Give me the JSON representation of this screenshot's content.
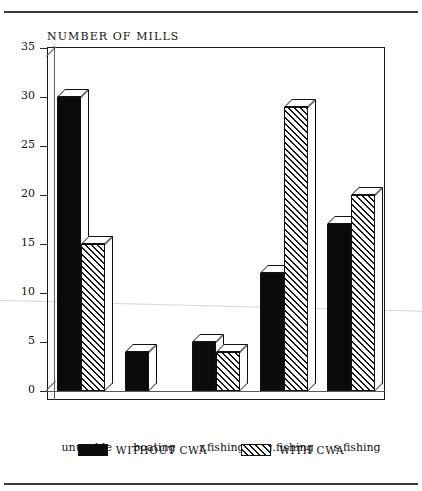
{
  "figure": {
    "title": "NUMBER OF MILLS",
    "rules": {
      "top": "page-rule-top",
      "bottom": "page-rule-bottom"
    }
  },
  "legend": {
    "entries": [
      {
        "label": "WITHOUT CWA",
        "pattern": "solid",
        "color": "#0b0b0b"
      },
      {
        "label": "WITH CWA",
        "pattern": "diagonal-hatch",
        "color": "#151515"
      }
    ]
  },
  "chart_data": {
    "type": "bar",
    "title": "NUMBER OF MILLS",
    "xlabel": "",
    "ylabel": "NUMBER OF MILLS",
    "categories": [
      "unusable",
      "boating",
      "r.fishing",
      "g.fishing",
      "s.fishing"
    ],
    "series": [
      {
        "name": "WITHOUT CWA",
        "values": [
          30,
          4,
          5,
          12,
          17
        ]
      },
      {
        "name": "WITH CWA",
        "values": [
          15,
          0,
          4,
          29,
          20
        ]
      }
    ],
    "ylim": [
      0,
      35
    ],
    "yticks": [
      0,
      5,
      10,
      15,
      20,
      25,
      30,
      35
    ],
    "ytick_labels": [
      "0",
      "5",
      "10",
      "15",
      "20",
      "25",
      "30",
      "35"
    ],
    "grid": false,
    "legend_position": "bottom-center",
    "style": "3d-grouped-bar"
  }
}
